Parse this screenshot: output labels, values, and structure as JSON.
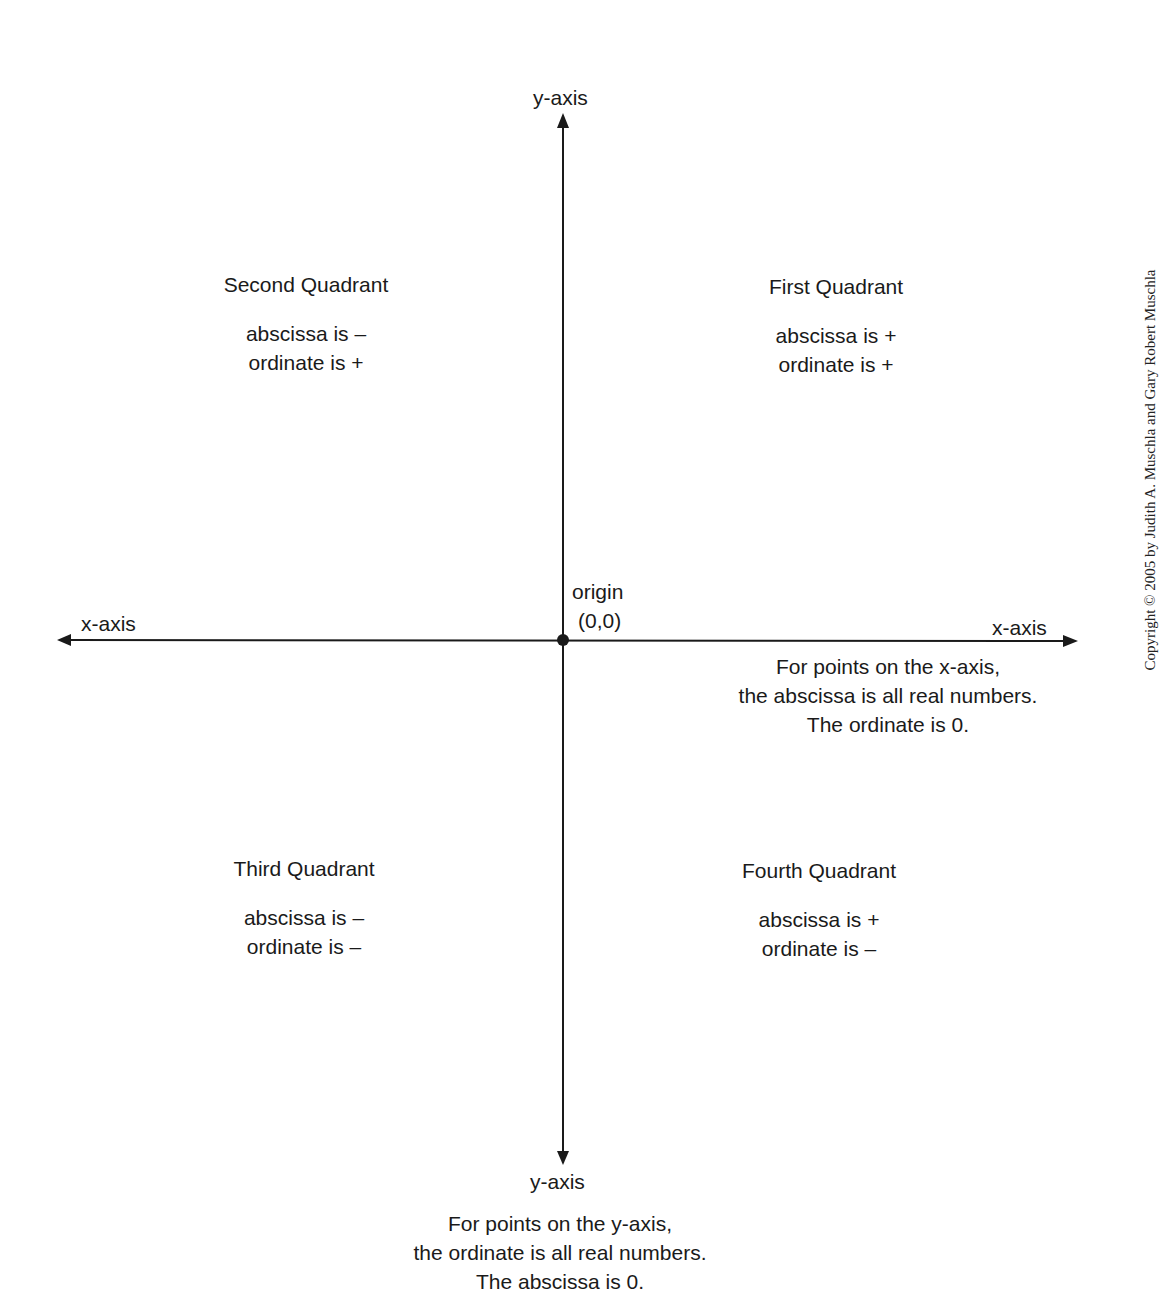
{
  "axes": {
    "y_axis_top_label": "y-axis",
    "y_axis_bottom_label": "y-axis",
    "x_axis_left_label": "x-axis",
    "x_axis_right_label": "x-axis",
    "origin_label": "origin",
    "origin_coords": "(0,0)",
    "line_color": "#1a1a1a"
  },
  "quadrants": {
    "first": {
      "title": "First Quadrant",
      "abscissa": "abscissa is +",
      "ordinate": "ordinate is +"
    },
    "second": {
      "title": "Second Quadrant",
      "abscissa": "abscissa is –",
      "ordinate": "ordinate is +"
    },
    "third": {
      "title": "Third Quadrant",
      "abscissa": "abscissa is –",
      "ordinate": "ordinate is –"
    },
    "fourth": {
      "title": "Fourth Quadrant",
      "abscissa": "abscissa is +",
      "ordinate": "ordinate is –"
    }
  },
  "notes": {
    "x_axis": {
      "line1": "For points on the x-axis,",
      "line2": "the abscissa is all real numbers.",
      "line3": "The ordinate is 0."
    },
    "y_axis": {
      "line1": "For points on the y-axis,",
      "line2": "the ordinate is all real numbers.",
      "line3": "The abscissa is 0."
    }
  },
  "copyright": "Copyright © 2005 by Judith A. Muschla and Gary Robert Muschla"
}
